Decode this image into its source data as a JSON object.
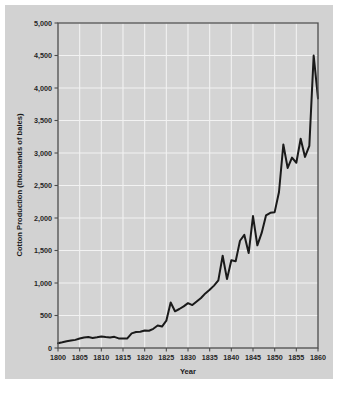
{
  "figure": {
    "background_color": "#d2d2d2",
    "page_background_color": "#ffffff",
    "plot_background_color": "#d4d4d4",
    "gridline_color": "#f2f2f2",
    "axis_color": "#4d4d4d",
    "line_color": "#1a1a1a"
  },
  "chart_data": {
    "type": "line",
    "title": "",
    "subtitle": "",
    "xlabel": "Year",
    "ylabel": "Cotton Production (thousands of bales)",
    "xlim": [
      1800,
      1860
    ],
    "ylim": [
      0,
      5000
    ],
    "grid": true,
    "legend": "none",
    "xticks": [
      1800,
      1805,
      1810,
      1815,
      1820,
      1825,
      1830,
      1835,
      1840,
      1845,
      1850,
      1855,
      1860
    ],
    "xtick_labels": [
      "1800",
      "1805",
      "1810",
      "1815",
      "1820",
      "1825",
      "1830",
      "1835",
      "1840",
      "1845",
      "1850",
      "1855",
      "1860"
    ],
    "yticks": [
      0,
      500,
      1000,
      1500,
      2000,
      2500,
      3000,
      3500,
      4000,
      4500,
      5000
    ],
    "ytick_labels": [
      "0",
      "500",
      "1,000",
      "1,500",
      "2,000",
      "2,500",
      "3,000",
      "3,500",
      "4,000",
      "4,500",
      "5,000"
    ],
    "series": [
      {
        "name": "Cotton Production",
        "color": "#1a1a1a",
        "x": [
          1800,
          1801,
          1802,
          1803,
          1804,
          1805,
          1806,
          1807,
          1808,
          1809,
          1810,
          1811,
          1812,
          1813,
          1814,
          1815,
          1816,
          1817,
          1818,
          1819,
          1820,
          1821,
          1822,
          1823,
          1824,
          1825,
          1826,
          1827,
          1828,
          1829,
          1830,
          1831,
          1832,
          1833,
          1834,
          1835,
          1836,
          1837,
          1838,
          1839,
          1840,
          1841,
          1842,
          1843,
          1844,
          1845,
          1846,
          1847,
          1848,
          1849,
          1850,
          1851,
          1852,
          1853,
          1854,
          1855,
          1856,
          1857,
          1858,
          1859,
          1860
        ],
        "y": [
          73,
          88,
          105,
          115,
          125,
          146,
          160,
          168,
          155,
          165,
          178,
          168,
          160,
          172,
          148,
          146,
          148,
          225,
          245,
          250,
          270,
          265,
          295,
          345,
          330,
          420,
          700,
          565,
          600,
          640,
          690,
          660,
          715,
          770,
          840,
          895,
          960,
          1040,
          1420,
          1060,
          1350,
          1335,
          1650,
          1740,
          1460,
          2030,
          1580,
          1770,
          2040,
          2080,
          2090,
          2400,
          3130,
          2770,
          2930,
          2850,
          3220,
          2940,
          3110,
          4500,
          3840
        ]
      }
    ]
  },
  "axis": {
    "y_title": "Cotton Production (thousands of bales)",
    "x_title": "Year"
  }
}
